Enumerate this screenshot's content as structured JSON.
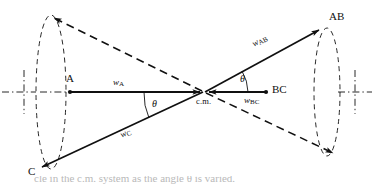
{
  "figure": {
    "kind": "vector-diagram",
    "background_color": "#ffffff",
    "stroke_color": "#101010",
    "width": 374,
    "height": 184
  },
  "labels": {
    "point_a": "A",
    "point_bc": "BC",
    "point_ab": "AB",
    "point_c": "C",
    "center_of_mass": "c.m.",
    "vector_a_symbol": "w",
    "vector_a_sub": "A",
    "vector_bc_symbol": "w",
    "vector_bc_sub": "BC",
    "vector_ab_symbol": "w",
    "vector_ab_sub": "AB",
    "vector_c_symbol": "w",
    "vector_c_sub": "C",
    "angle_upper": "θ",
    "angle_lower": "θ"
  },
  "caption": {
    "text": "cle in the c.m. system as the angle θ is varied."
  },
  "geometry": {
    "cm": {
      "x": 204,
      "y": 92
    },
    "reactant_axis": {
      "x1": 6,
      "y1": 92,
      "x2": 368,
      "y2": 92
    },
    "vectors": [
      {
        "name": "w-A",
        "style": "solid",
        "from": {
          "x": 70,
          "y": 92
        },
        "to": {
          "x": 202,
          "y": 92
        },
        "arrow_at": "to"
      },
      {
        "name": "w-BC",
        "style": "solid",
        "from": {
          "x": 206,
          "y": 92
        },
        "to": {
          "x": 268,
          "y": 92
        },
        "arrow_at": "to"
      },
      {
        "name": "w-AB",
        "style": "solid",
        "from": {
          "x": 204,
          "y": 92
        },
        "to": {
          "x": 323,
          "y": 27
        },
        "arrow_at": "to"
      },
      {
        "name": "w-C",
        "style": "solid",
        "from": {
          "x": 204,
          "y": 92
        },
        "to": {
          "x": 38,
          "y": 170
        },
        "arrow_at": "to"
      },
      {
        "name": "cone-upper-left",
        "style": "dashed",
        "from": {
          "x": 204,
          "y": 92
        },
        "to": {
          "x": 51,
          "y": 16
        },
        "arrow_at": "to"
      },
      {
        "name": "cone-lower-right",
        "style": "dashed",
        "from": {
          "x": 204,
          "y": 92
        },
        "to": {
          "x": 336,
          "y": 155
        },
        "arrow_at": "to"
      }
    ],
    "cones": [
      {
        "name": "left-cone-ellipse",
        "cx": 51,
        "cy": 92,
        "rx": 15,
        "ry": 77
      },
      {
        "name": "right-cone-ellipse",
        "cx": 327,
        "cy": 92,
        "rx": 13,
        "ry": 64
      }
    ],
    "angles": [
      {
        "name": "theta-upper",
        "cx": 204,
        "cy": 92,
        "r": 40,
        "from_deg": 0,
        "to_deg": -28
      },
      {
        "name": "theta-lower",
        "cx": 204,
        "cy": 92,
        "r": 60,
        "from_deg": 180,
        "to_deg": 155
      }
    ]
  }
}
